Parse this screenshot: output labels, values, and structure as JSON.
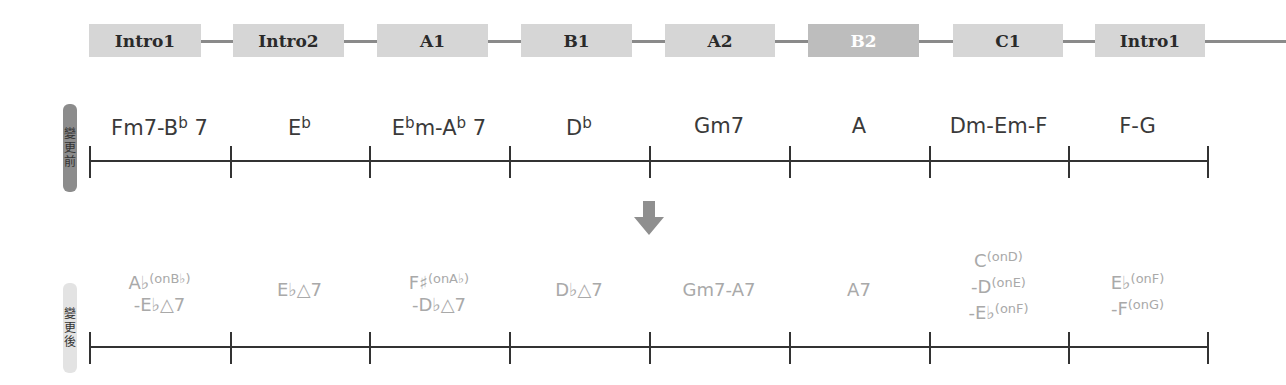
{
  "sections": {
    "items": [
      {
        "label": "Intro1",
        "left": 89,
        "width": 112,
        "highlight": false
      },
      {
        "label": "Intro2",
        "left": 233,
        "width": 111,
        "highlight": false
      },
      {
        "label": "A1",
        "left": 377,
        "width": 111,
        "highlight": false
      },
      {
        "label": "B1",
        "left": 521,
        "width": 111,
        "highlight": false
      },
      {
        "label": "A2",
        "left": 665,
        "width": 110,
        "highlight": false
      },
      {
        "label": "B2",
        "left": 808,
        "width": 111,
        "highlight": true
      },
      {
        "label": "C1",
        "left": 953,
        "width": 110,
        "highlight": false
      },
      {
        "label": "Intro1",
        "left": 1095,
        "width": 110,
        "highlight": false
      }
    ],
    "connector_color": "#8a8a8a",
    "box_color": "#d6d6d6",
    "highlight_box_color": "#bdbdbd"
  },
  "before": {
    "label": "變更前",
    "label_chars": [
      "變",
      "更",
      "前"
    ],
    "text_color": "#3a3a3a",
    "chords": [
      {
        "root": "Fm7-B",
        "acc": "b",
        "rest": " 7"
      },
      {
        "root": "E",
        "acc": "b",
        "rest": ""
      },
      {
        "root": "E",
        "acc": "b",
        "rest": "m-A",
        "acc2": "b",
        "rest2": " 7"
      },
      {
        "root": "D",
        "acc": "b",
        "rest": ""
      },
      {
        "root": "Gm7",
        "acc": "",
        "rest": ""
      },
      {
        "root": "A",
        "acc": "",
        "rest": ""
      },
      {
        "root": "Dm-Em-F",
        "acc": "",
        "rest": ""
      },
      {
        "root": "F-G",
        "acc": "",
        "rest": ""
      }
    ]
  },
  "arrow": {
    "icon": "down-arrow-icon",
    "color": "#8f8f8f"
  },
  "after": {
    "label": "變更後",
    "label_chars": [
      "變",
      "更",
      "後"
    ],
    "text_color": "#a9a9a9",
    "chords": [
      {
        "lines": [
          "A♭(onB♭)",
          "-E♭△7"
        ]
      },
      {
        "lines": [
          "E♭△7"
        ]
      },
      {
        "lines": [
          "F♯(onA♭)",
          "-D♭△7"
        ]
      },
      {
        "lines": [
          "D♭△7"
        ]
      },
      {
        "lines": [
          "Gm7-A7"
        ]
      },
      {
        "lines": [
          "A7"
        ]
      },
      {
        "lines": [
          "C(onD)",
          "-D(onE)",
          "-E♭(onF)"
        ]
      },
      {
        "lines": [
          "E♭(onF)",
          "-F(onG)"
        ]
      }
    ]
  },
  "timeline": {
    "ticks_x": [
      89,
      230,
      369,
      509,
      649,
      789,
      929,
      1068,
      1207
    ]
  }
}
